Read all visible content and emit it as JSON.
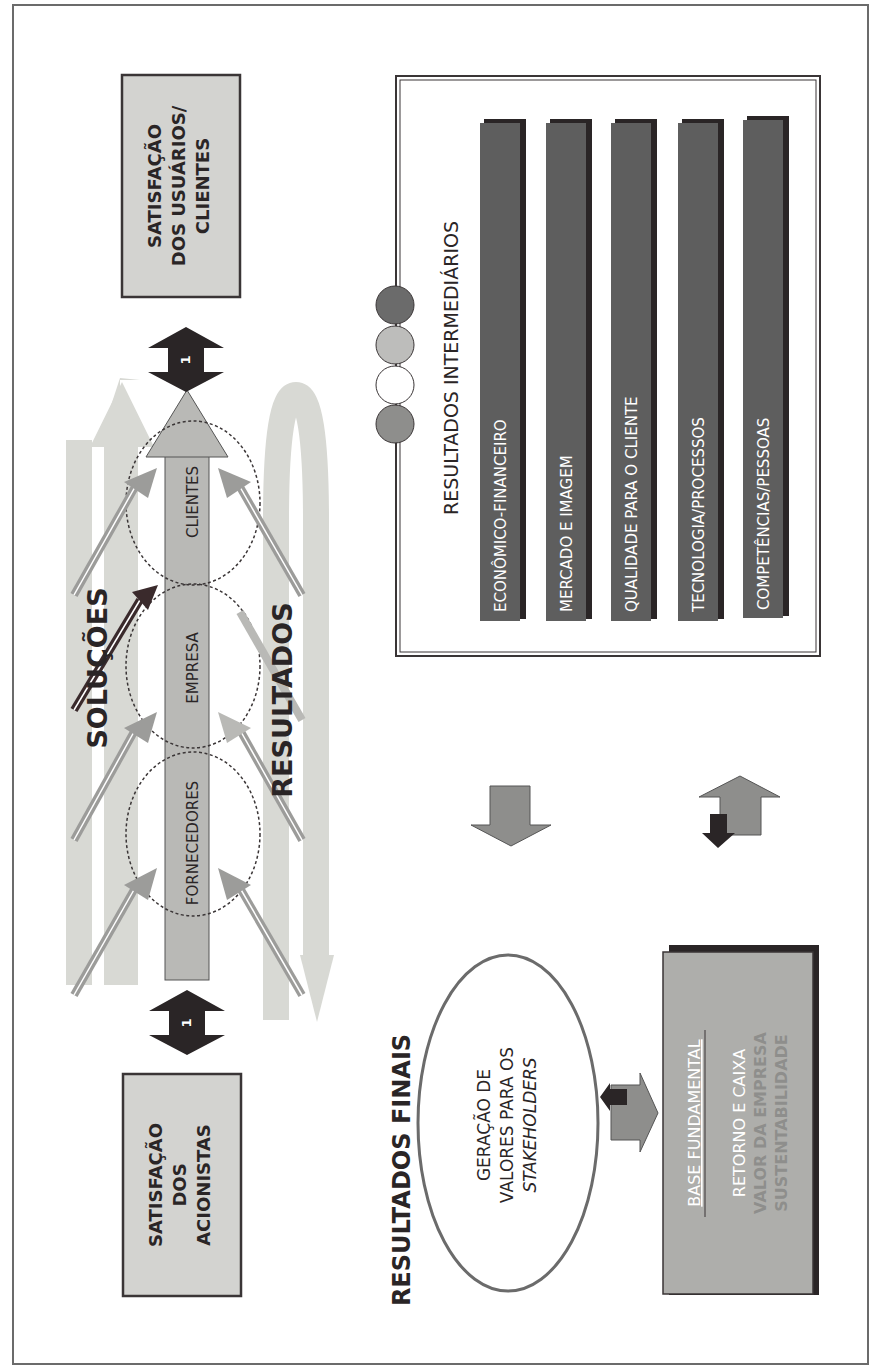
{
  "diagram": {
    "orientation": "rotated 90 degrees counter-clockwise",
    "colors": {
      "frame": "#6b6b6b",
      "box_fill": "#d3d3d0",
      "dark": "#2a2526",
      "bar_fill": "#5e5e5e",
      "light_arrow": "#d8d9d4",
      "mid_arrow": "#9c9c9a",
      "central_arrow": "#b9b9b6"
    },
    "left_box": {
      "lines": [
        "SATISFAÇÃO",
        "DOS",
        "ACIONISTAS"
      ]
    },
    "right_box": {
      "lines": [
        "SATISFAÇÃO",
        "DOS USUÁRIOS/",
        "CLIENTES"
      ]
    },
    "link_arrows": {
      "left_label": "1",
      "right_label": "1"
    },
    "flow": {
      "top_label": "SOLUÇÕES",
      "bottom_label": "RESULTADOS",
      "stages": [
        "FORNECEDORES",
        "EMPRESA",
        "CLIENTES"
      ]
    },
    "intermediate": {
      "title": "RESULTADOS INTERMEDIÁRIOS",
      "bars": [
        "ECONÔMICO-FINANCEIRO",
        "MERCADO E IMAGEM",
        "QUALIDADE PARA O CLIENTE",
        "TECNOLOGIA/PROCESSOS",
        "COMPETÊNCIAS/PESSOAS"
      ],
      "indicator_circles": [
        "#6b6b6b",
        "#bdbdbb",
        "#ffffff",
        "#8e8e8c"
      ]
    },
    "final": {
      "title": "RESULTADOS FINAIS",
      "ellipse_lines": [
        "GERAÇÃO DE",
        "VALORES PARA OS",
        "STAKEHOLDERS"
      ],
      "base": {
        "heading": "BASE FUNDAMENTAL",
        "lines": [
          "RETORNO E CAIXA",
          "VALOR DA EMPRESA",
          "SUSTENTABILIDADE"
        ]
      }
    }
  }
}
